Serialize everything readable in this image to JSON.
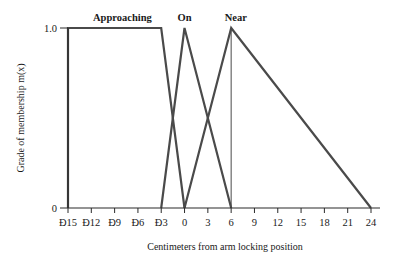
{
  "chart_data": {
    "type": "line",
    "title": "",
    "xlabel": "Centimeters from arm locking position",
    "ylabel": "Grade of membership m(x)",
    "xlim": [
      -15,
      24
    ],
    "ylim": [
      0,
      1.0
    ],
    "x_ticks": [
      -15,
      -12,
      -9,
      -6,
      -3,
      0,
      3,
      6,
      9,
      12,
      15,
      18,
      21,
      24
    ],
    "x_tick_labels": [
      "Ð15",
      "Ð12",
      "Ð9",
      "Ð6",
      "Ð3",
      "0",
      "3",
      "6",
      "9",
      "12",
      "15",
      "18",
      "21",
      "24"
    ],
    "y_ticks": [
      0,
      1.0
    ],
    "y_tick_labels": [
      "0",
      "1.0"
    ],
    "grid": false,
    "legend": "inline labels above peaks",
    "series": [
      {
        "name": "Approaching",
        "x": [
          -15,
          -15,
          -3,
          0
        ],
        "y": [
          0,
          1,
          1,
          0
        ],
        "label_x": -8
      },
      {
        "name": "On",
        "x": [
          -3,
          0,
          6
        ],
        "y": [
          0,
          1,
          0
        ],
        "label_x": 0
      },
      {
        "name": "Near",
        "x": [
          0,
          6,
          24
        ],
        "y": [
          0,
          1,
          0
        ],
        "label_x": 6.6
      }
    ],
    "annotations": [
      {
        "type": "vertical-line",
        "x": 6,
        "y_from": 0,
        "y_to": 1
      }
    ],
    "colors": {
      "line": "#4a4a4a",
      "axis": "#2a2a2a",
      "text": "#1a1a1a"
    }
  }
}
